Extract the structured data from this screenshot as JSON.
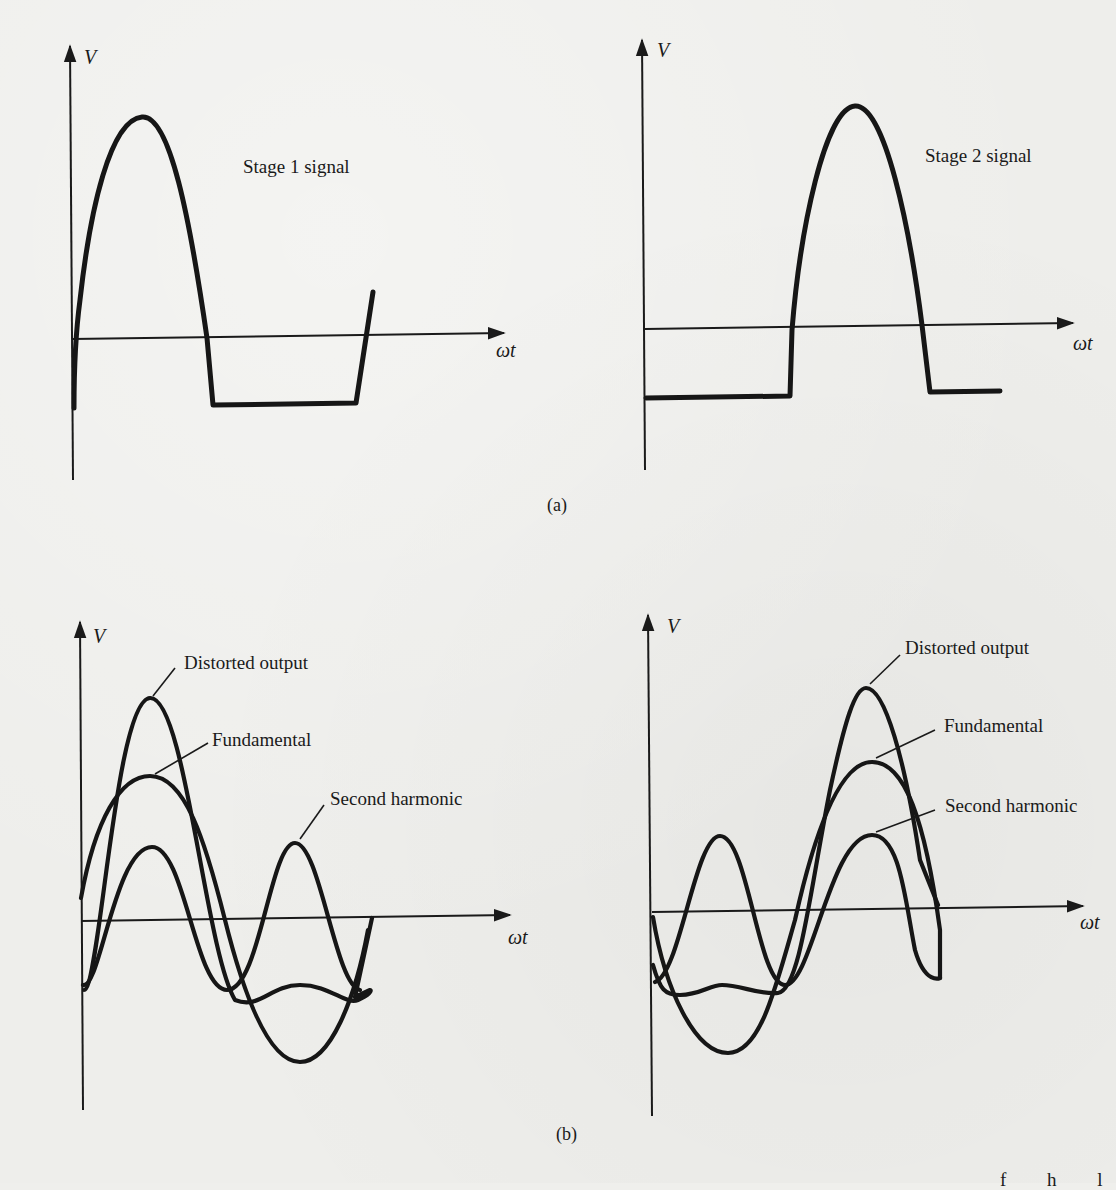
{
  "figure": {
    "panel_a": {
      "caption": "(a)",
      "left_plot": {
        "y_axis_label": "V",
        "x_axis_label": "ωt",
        "signal_label": "Stage 1 signal"
      },
      "right_plot": {
        "y_axis_label": "V",
        "x_axis_label": "ωt",
        "signal_label": "Stage 2 signal"
      }
    },
    "panel_b": {
      "caption": "(b)",
      "left_plot": {
        "y_axis_label": "V",
        "x_axis_label": "ωt",
        "labels": {
          "distorted": "Distorted output",
          "fundamental": "Fundamental",
          "second_harmonic": "Second harmonic"
        }
      },
      "right_plot": {
        "y_axis_label": "V",
        "x_axis_label": "ωt",
        "labels": {
          "distorted": "Distorted output",
          "fundamental": "Fundamental",
          "second_harmonic": "Second harmonic"
        }
      }
    },
    "cut_off_text": "f   h   l"
  },
  "colors": {
    "paper": "#eeeeeb",
    "ink": "#1a1a1a"
  }
}
